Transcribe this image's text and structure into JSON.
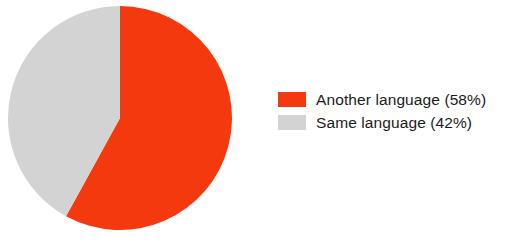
{
  "chart_data": {
    "type": "pie",
    "title": "",
    "subtitle": "",
    "xlabel": "",
    "ylabel": "",
    "grid": false,
    "legend_position": "right",
    "start_angle_deg": 0,
    "direction": "clockwise",
    "categories": [
      "Another language",
      "Same language"
    ],
    "values": [
      58,
      42
    ],
    "value_unit": "%",
    "colors": [
      "#f4390f",
      "#d3d3d3"
    ],
    "slices": [
      {
        "label": "Another language",
        "value": 58,
        "display": "58%",
        "color": "#f4390f",
        "legend_text": "Another language (58%)",
        "start_deg": 0,
        "end_deg": 208.8
      },
      {
        "label": "Same language",
        "value": 42,
        "display": "42%",
        "color": "#d3d3d3",
        "legend_text": "Same language (42%)",
        "start_deg": 208.8,
        "end_deg": 360
      }
    ],
    "annotations": []
  },
  "legend": {
    "items": [
      {
        "label": "Another language (58%)",
        "color": "#f4390f",
        "swatch_name": "legend-swatch-another-language"
      },
      {
        "label": "Same language (42%)",
        "color": "#d3d3d3",
        "swatch_name": "legend-swatch-same-language"
      }
    ]
  },
  "pie": {
    "center_x": 120,
    "center_y": 118,
    "radius": 112
  }
}
